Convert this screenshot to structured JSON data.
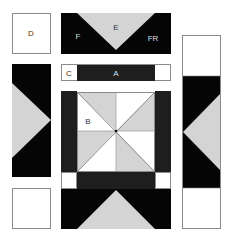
{
  "colors": {
    "black": "#050505",
    "dark": "#1e1e1e",
    "gray": "#d4d4d4",
    "white": "#ffffff",
    "outline": "#8a8a8a"
  },
  "pieces": {
    "D": {
      "label": "D"
    },
    "E": {
      "label": "E"
    },
    "F": {
      "label": "F"
    },
    "FR": {
      "label": "FR"
    },
    "C": {
      "label": "C"
    },
    "A": {
      "label": "A"
    },
    "B": {
      "label": "B"
    }
  }
}
